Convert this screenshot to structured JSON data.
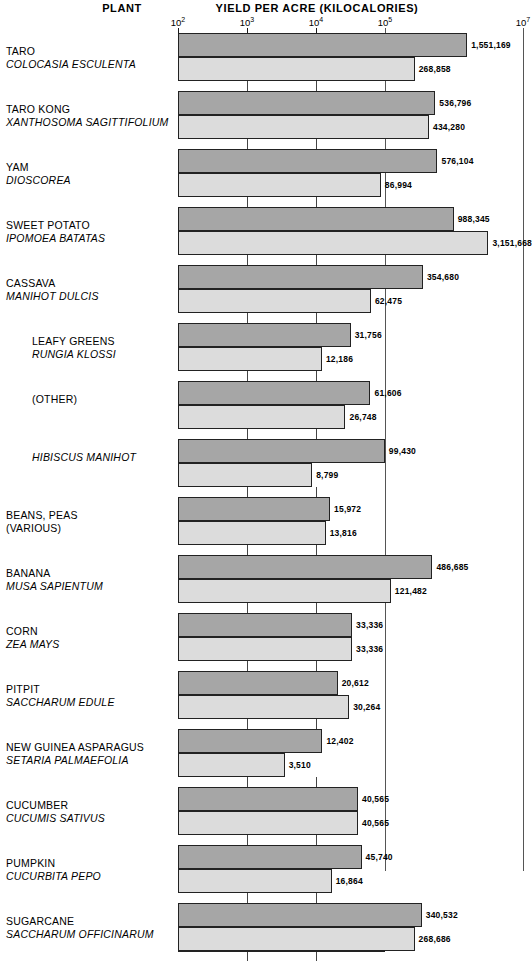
{
  "header": {
    "plant_label": "PLANT",
    "yield_label": "YIELD PER ACRE  (KILOCALORIES)"
  },
  "axis": {
    "ticks": [
      {
        "label": "10",
        "exp": "2",
        "value": 100
      },
      {
        "label": "10",
        "exp": "3",
        "value": 1000
      },
      {
        "label": "10",
        "exp": "4",
        "value": 10000
      },
      {
        "label": "10",
        "exp": "5",
        "value": 100000
      },
      {
        "label": "10",
        "exp": "7",
        "value": 10000000
      }
    ],
    "scale": "log10",
    "min": 100,
    "max": 10000000
  },
  "colors": {
    "series_1": "#a6a6a6",
    "series_2": "#dcdcdc",
    "outline": "#222222",
    "background": "#ffffff"
  },
  "chart_data": {
    "type": "bar",
    "orientation": "horizontal",
    "title": "YIELD PER ACRE  (KILOCALORIES)",
    "xlabel": "YIELD PER ACRE (KILOCALORIES)",
    "ylabel": "PLANT",
    "xscale": "log",
    "xlim": [
      100,
      10000000
    ],
    "xticks": [
      100,
      1000,
      10000,
      100000,
      10000000
    ],
    "xticklabels": [
      "10^2",
      "10^3",
      "10^4",
      "10^5",
      "10^7"
    ],
    "grid": true,
    "legend": "none",
    "series": [
      {
        "name": "series-1",
        "color": "#a6a6a6"
      },
      {
        "name": "series-2",
        "color": "#dcdcdc"
      }
    ],
    "categories": [
      "TARO",
      "TARO KONG",
      "YAM",
      "SWEET POTATO",
      "CASSAVA",
      "LEAFY GREENS",
      "(OTHER)",
      "HIBISCUS MANIHOT",
      "BEANS, PEAS",
      "BANANA",
      "CORN",
      "PITPIT",
      "NEW GUINEA ASPARAGUS",
      "CUCUMBER",
      "PUMPKIN",
      "SUGARCANE"
    ],
    "values_series_1": [
      1551169,
      536796,
      576104,
      988345,
      354680,
      31756,
      61606,
      99430,
      15972,
      486685,
      33336,
      20612,
      12402,
      40565,
      45740,
      340532
    ],
    "values_series_2": [
      268858,
      434280,
      86994,
      3151668,
      62475,
      12186,
      26748,
      8799,
      13816,
      121482,
      33336,
      30264,
      3510,
      40565,
      16864,
      268686
    ]
  },
  "rows": [
    {
      "common": "TARO",
      "latin": "COLOCASIA ESCULENTA",
      "indent": false,
      "bar1": {
        "value": 1551169,
        "text": "1,551,169"
      },
      "bar2": {
        "value": 268858,
        "text": "268,858"
      }
    },
    {
      "common": "TARO KONG",
      "latin": "XANTHOSOMA SAGITTIFOLIUM",
      "indent": false,
      "bar1": {
        "value": 536796,
        "text": "536,796"
      },
      "bar2": {
        "value": 434280,
        "text": "434,280"
      }
    },
    {
      "common": "YAM",
      "latin": "DIOSCOREA",
      "indent": false,
      "bar1": {
        "value": 576104,
        "text": "576,104"
      },
      "bar2": {
        "value": 86994,
        "text": "86,994"
      }
    },
    {
      "common": "SWEET POTATO",
      "latin": "IPOMOEA BATATAS",
      "indent": false,
      "bar1": {
        "value": 988345,
        "text": "988,345"
      },
      "bar2": {
        "value": 3151668,
        "text": "3,151,668"
      }
    },
    {
      "common": "CASSAVA",
      "latin": "MANIHOT DULCIS",
      "indent": false,
      "bar1": {
        "value": 354680,
        "text": "354,680"
      },
      "bar2": {
        "value": 62475,
        "text": "62,475"
      }
    },
    {
      "common": "LEAFY GREENS",
      "latin": "RUNGIA KLOSSI",
      "indent": true,
      "bar1": {
        "value": 31756,
        "text": "31,756"
      },
      "bar2": {
        "value": 12186,
        "text": "12,186"
      }
    },
    {
      "common": "(OTHER)",
      "latin": "",
      "indent": true,
      "bar1": {
        "value": 61606,
        "text": "61,606"
      },
      "bar2": {
        "value": 26748,
        "text": "26,748"
      }
    },
    {
      "common": "",
      "latin": "HIBISCUS MANIHOT",
      "indent": true,
      "bar1": {
        "value": 99430,
        "text": "99,430"
      },
      "bar2": {
        "value": 8799,
        "text": "8,799"
      }
    },
    {
      "common": "BEANS, PEAS",
      "latin": "",
      "common2": "(VARIOUS)",
      "indent": false,
      "bar1": {
        "value": 15972,
        "text": "15,972"
      },
      "bar2": {
        "value": 13816,
        "text": "13,816"
      }
    },
    {
      "common": "BANANA",
      "latin": "MUSA SAPIENTUM",
      "indent": false,
      "bar1": {
        "value": 486685,
        "text": "486,685"
      },
      "bar2": {
        "value": 121482,
        "text": "121,482"
      }
    },
    {
      "common": "CORN",
      "latin": "ZEA MAYS",
      "indent": false,
      "bar1": {
        "value": 33336,
        "text": "33,336"
      },
      "bar2": {
        "value": 33336,
        "text": "33,336"
      }
    },
    {
      "common": "PITPIT",
      "latin": "SACCHARUM EDULE",
      "indent": false,
      "bar1": {
        "value": 20612,
        "text": "20,612"
      },
      "bar2": {
        "value": 30264,
        "text": "30,264"
      }
    },
    {
      "common": "NEW GUINEA ASPARAGUS",
      "latin": "SETARIA PALMAEFOLIA",
      "indent": false,
      "bar1": {
        "value": 12402,
        "text": "12,402"
      },
      "bar2": {
        "value": 3510,
        "text": "3,510"
      }
    },
    {
      "common": "CUCUMBER",
      "latin": "CUCUMIS SATIVUS",
      "indent": false,
      "bar1": {
        "value": 40565,
        "text": "40,565"
      },
      "bar2": {
        "value": 40565,
        "text": "40,565"
      }
    },
    {
      "common": "PUMPKIN",
      "latin": "CUCURBITA PEPO",
      "indent": false,
      "bar1": {
        "value": 45740,
        "text": "45,740"
      },
      "bar2": {
        "value": 16864,
        "text": "16,864"
      }
    },
    {
      "common": "SUGARCANE",
      "latin": "SACCHARUM OFFICINARUM",
      "indent": false,
      "bar1": {
        "value": 340532,
        "text": "340,532"
      },
      "bar2": {
        "value": 268686,
        "text": "268,686"
      }
    }
  ]
}
